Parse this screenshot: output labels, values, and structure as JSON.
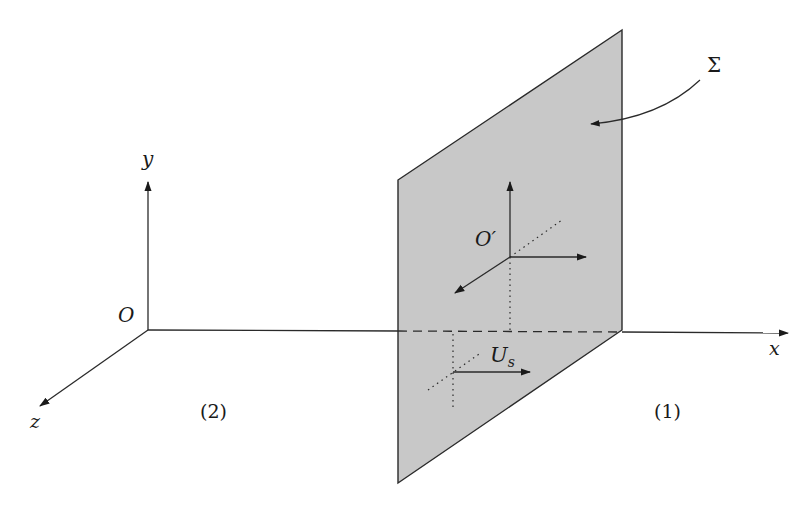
{
  "diagram": {
    "title": "",
    "colors": {
      "plane_fill": "#c8c8c8",
      "stroke": "#2a2a2a",
      "background": "#ffffff"
    },
    "axes": {
      "origin_label": "O",
      "x_label": "x",
      "y_label": "y",
      "z_label": "z"
    },
    "plane": {
      "label": "Σ"
    },
    "moving_frame": {
      "origin_label": "O′"
    },
    "velocity": {
      "label_main": "U",
      "label_sub": "s"
    },
    "regions": {
      "left": "(2)",
      "right": "(1)"
    }
  }
}
